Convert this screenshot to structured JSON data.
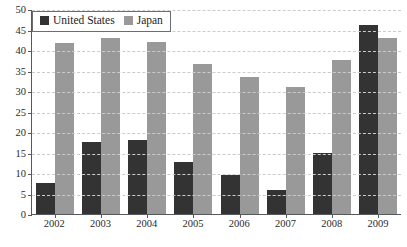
{
  "chart_data": {
    "type": "bar",
    "title": "",
    "subtitle": "",
    "xlabel": "",
    "ylabel": "",
    "categories": [
      "2002",
      "2003",
      "2004",
      "2005",
      "2006",
      "2007",
      "2008",
      "2009"
    ],
    "series": [
      {
        "name": "United States",
        "color": "#333333",
        "values": [
          7.5,
          17.5,
          18.0,
          12.8,
          9.5,
          5.8,
          15.0,
          46.0
        ]
      },
      {
        "name": "Japan",
        "color": "#999999",
        "values": [
          41.8,
          43.0,
          42.0,
          36.5,
          33.5,
          31.0,
          37.5,
          43.0
        ]
      }
    ],
    "ylim": [
      0,
      50
    ],
    "ytick_step": 5,
    "yticks": [
      "0",
      "5",
      "10",
      "15",
      "20",
      "25",
      "30",
      "35",
      "40",
      "45",
      "50"
    ],
    "grid": "horizontal-dashed",
    "legend_position": "top-left-inside"
  },
  "legend": {
    "entries": [
      {
        "label": "United States",
        "swatch": "us"
      },
      {
        "label": "Japan",
        "swatch": "jp"
      }
    ]
  },
  "caption": {
    "clipped_text": "         "
  }
}
